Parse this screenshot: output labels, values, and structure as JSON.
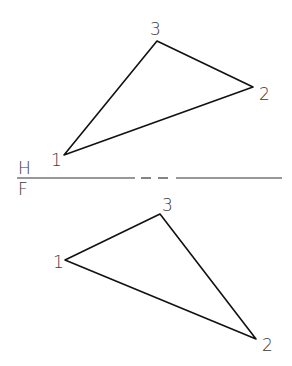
{
  "reference_line": {
    "upper_label": "H",
    "lower_label": "F",
    "y": 178
  },
  "top_view": {
    "vertices": [
      {
        "label": "1",
        "x": 64,
        "y": 155,
        "lx": 51,
        "ly": 166
      },
      {
        "label": "2",
        "x": 253,
        "y": 87,
        "lx": 259,
        "ly": 100
      },
      {
        "label": "3",
        "x": 157,
        "y": 41,
        "lx": 150,
        "ly": 35
      }
    ]
  },
  "front_view": {
    "vertices": [
      {
        "label": "1",
        "x": 65,
        "y": 260,
        "lx": 53,
        "ly": 268
      },
      {
        "label": "2",
        "x": 256,
        "y": 339,
        "lx": 262,
        "ly": 351
      },
      {
        "label": "3",
        "x": 160,
        "y": 214,
        "lx": 162,
        "ly": 211
      }
    ]
  },
  "colors": {
    "line": "#111111",
    "label": "#3a3a3a",
    "background": "#ffffff"
  }
}
